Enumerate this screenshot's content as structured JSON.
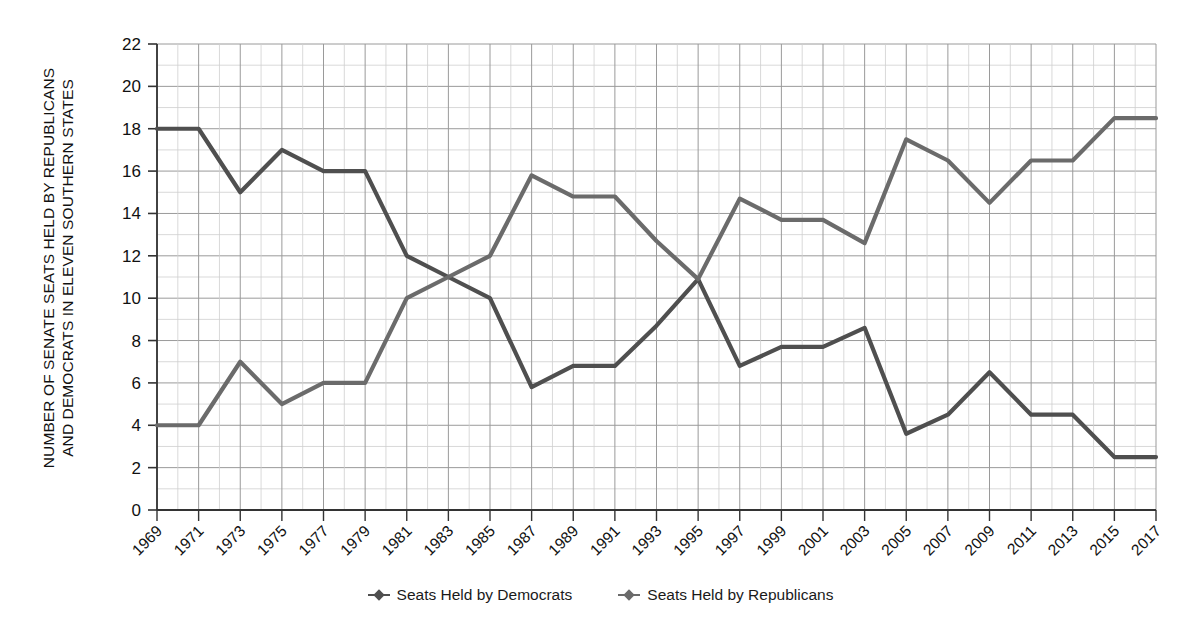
{
  "figure": {
    "background": "#ffffff",
    "ylabel": "NUMBER OF SENATE SEATS HELD BY REPUBLICANS\nAND DEMOCRATS IN ELEVEN SOUTHERN STATES"
  },
  "legend": {
    "position": "bottom-center",
    "items": [
      {
        "label": "Seats Held by Democrats",
        "color": "#4f4f4f",
        "marker": "diamond-line-marker"
      },
      {
        "label": "Seats Held by Republicans",
        "color": "#6b6b6b",
        "marker": "diamond-line-marker"
      }
    ]
  },
  "chart_data": {
    "type": "line",
    "title": "",
    "xlabel": "",
    "ylabel": "NUMBER OF SENATE SEATS HELD BY REPUBLICANS AND DEMOCRATS IN ELEVEN SOUTHERN STATES",
    "x": [
      1969,
      1971,
      1973,
      1975,
      1977,
      1979,
      1981,
      1983,
      1985,
      1987,
      1989,
      1991,
      1993,
      1995,
      1997,
      1999,
      2001,
      2003,
      2005,
      2007,
      2009,
      2011,
      2013,
      2015,
      2017
    ],
    "xticklabels": [
      "1969",
      "1971",
      "1973",
      "1975",
      "1977",
      "1979",
      "1981",
      "1983",
      "1985",
      "1987",
      "1989",
      "1991",
      "1993",
      "1995",
      "1997",
      "1999",
      "2001",
      "2003",
      "2005",
      "2007",
      "2009",
      "2011",
      "2013",
      "2015",
      "2017"
    ],
    "yticks": [
      0,
      2,
      4,
      6,
      8,
      10,
      12,
      14,
      16,
      18,
      20,
      22
    ],
    "yticklabels": [
      "0",
      "2",
      "4",
      "6",
      "8",
      "10",
      "12",
      "14",
      "16",
      "18",
      "20",
      "22"
    ],
    "ylim": [
      0,
      22
    ],
    "xlim": [
      1969,
      2017
    ],
    "grid": true,
    "series": [
      {
        "name": "Seats Held by Democrats",
        "color": "#4f4f4f",
        "values": [
          18,
          18,
          15,
          17,
          16,
          16,
          12,
          11,
          10,
          5.8,
          6.8,
          6.8,
          8.7,
          10.9,
          6.8,
          7.7,
          7.7,
          8.6,
          3.6,
          4.5,
          6.5,
          4.5,
          4.5,
          2.5,
          2.5
        ]
      },
      {
        "name": "Seats Held by Republicans",
        "color": "#6b6b6b",
        "values": [
          4,
          4,
          7,
          5,
          6,
          6,
          10,
          11,
          12,
          15.8,
          14.8,
          14.8,
          12.7,
          10.9,
          14.7,
          13.7,
          13.7,
          12.6,
          17.5,
          16.5,
          14.5,
          16.5,
          16.5,
          18.5,
          18.5
        ]
      }
    ]
  }
}
